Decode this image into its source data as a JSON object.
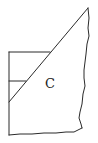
{
  "diagram": {
    "type": "geometric-region-sketch",
    "label": "C",
    "stroke_color": "#2a2a2a",
    "background": "#ffffff",
    "elements": [
      {
        "name": "diagonal-edge",
        "from": [
          88,
          8
        ],
        "to": [
          9,
          102
        ]
      },
      {
        "name": "left-edge",
        "from": [
          9,
          52
        ],
        "to": [
          9,
          135
        ]
      },
      {
        "name": "top-horizontal",
        "from": [
          9,
          52
        ],
        "to": [
          50,
          52
        ]
      },
      {
        "name": "middle-horizontal",
        "from": [
          9,
          81
        ],
        "to": [
          26,
          81
        ]
      },
      {
        "name": "right-torn-edge",
        "from": [
          88,
          8
        ],
        "to": [
          82,
          128
        ]
      },
      {
        "name": "bottom-torn-edge",
        "from": [
          9,
          135
        ],
        "to": [
          82,
          131
        ]
      }
    ]
  }
}
